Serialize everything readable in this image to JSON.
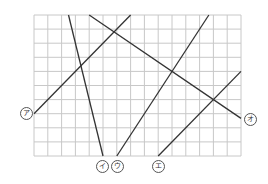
{
  "diagram": {
    "type": "line-grid-figure",
    "grid": {
      "columns": 15,
      "rows": 10,
      "origin_px": [
        34,
        15
      ],
      "cell_w": 13.8,
      "cell_h": 14.1,
      "line_color": "#c8c8c8"
    },
    "stroke_color": "#333333",
    "lines": [
      {
        "id": "a",
        "label": "ア",
        "from": [
          0,
          7
        ],
        "to": [
          7,
          0
        ],
        "label_pos_px": [
          26,
          113
        ]
      },
      {
        "id": "i",
        "label": "イ",
        "from": [
          2.5,
          0
        ],
        "to": [
          5,
          10
        ],
        "label_pos_px": [
          102,
          166
        ]
      },
      {
        "id": "u",
        "label": "ウ",
        "from": [
          6,
          10
        ],
        "to": [
          12.67,
          0
        ],
        "label_pos_px": [
          117,
          166
        ]
      },
      {
        "id": "e",
        "label": "エ",
        "from": [
          9,
          10
        ],
        "to": [
          15,
          4
        ],
        "label_pos_px": [
          158,
          166
        ]
      },
      {
        "id": "o",
        "label": "オ",
        "from": [
          4,
          0
        ],
        "to": [
          15,
          7.33
        ],
        "label_pos_px": [
          250,
          119
        ]
      }
    ]
  }
}
